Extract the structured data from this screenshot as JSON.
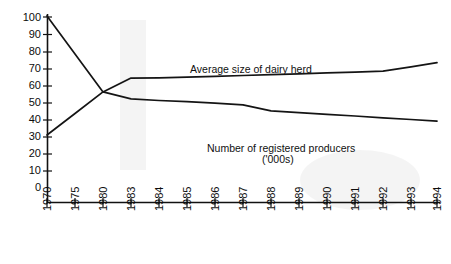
{
  "chart_data": {
    "type": "line",
    "title": "",
    "xlabel": "",
    "ylabel": "",
    "ylim": [
      0,
      100
    ],
    "ytick_step": 10,
    "yticks": [
      0,
      10,
      20,
      30,
      40,
      50,
      60,
      70,
      80,
      90,
      100
    ],
    "grid": false,
    "legend_position": "inline-annotations",
    "categories": [
      "1970",
      "1975",
      "1980",
      "1983",
      "1984",
      "1985",
      "1986",
      "1987",
      "1988",
      "1989",
      "1990",
      "1991",
      "1992",
      "1993",
      "1994"
    ],
    "series": [
      {
        "name": "Average size of dairy herd",
        "values": [
          31,
          43.5,
          56,
          64,
          64.2,
          64.5,
          65,
          65.5,
          66,
          66.5,
          67,
          67.5,
          68,
          70.5,
          73
        ]
      },
      {
        "name": "Number of registered producers ('000s)",
        "values": [
          100,
          78,
          56,
          52,
          51,
          50.3,
          49.5,
          48.5,
          45,
          44,
          43,
          42,
          41,
          40,
          39
        ]
      }
    ],
    "annotations": [
      {
        "text": "Average size of dairy herd",
        "series": "Average size of dairy herd"
      },
      {
        "text": "Number of registered producers",
        "series": "Number of registered producers ('000s)"
      },
      {
        "text": "('000s)",
        "series": "Number of registered producers ('000s)"
      }
    ]
  },
  "axes": {
    "y_labels": [
      "100",
      "90",
      "80",
      "70",
      "60",
      "50",
      "40",
      "30",
      "20",
      "10",
      "0"
    ],
    "x_labels": [
      "1970",
      "1975",
      "1980",
      "1983",
      "1984",
      "1985",
      "1986",
      "1987",
      "1988",
      "1989",
      "1990",
      "1991",
      "1992",
      "1993",
      "1994"
    ]
  },
  "labels": {
    "herd": "Average size of dairy herd",
    "producers_line1": "Number of registered producers",
    "producers_line2": "('000s)"
  },
  "colors": {
    "ink": "#141414",
    "paper": "#ffffff"
  }
}
